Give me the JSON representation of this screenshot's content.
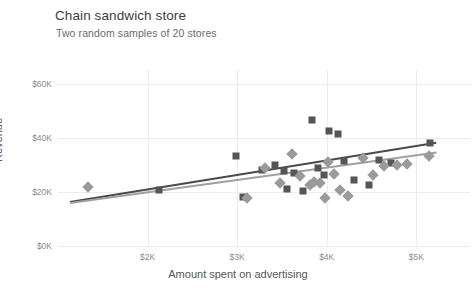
{
  "header": {
    "title": "Chain sandwich store",
    "subtitle": "Two random samples of 20 stores"
  },
  "chart_data": {
    "type": "scatter",
    "title": "Chain sandwich store",
    "subtitle": "Two random samples of 20 stores",
    "xlabel": "Amount spent on advertising",
    "ylabel": "Revenue",
    "xlim": [
      1000,
      5600
    ],
    "ylim": [
      0,
      65000
    ],
    "xticks": [
      2000,
      3000,
      4000,
      5000
    ],
    "xticklabels": [
      "$2K",
      "$3K",
      "$4K",
      "$5K"
    ],
    "yticks": [
      0,
      20000,
      40000,
      60000
    ],
    "yticklabels": [
      "$0K",
      "$20K",
      "$40K",
      "$60K"
    ],
    "grid": true,
    "legend": "none",
    "series": [
      {
        "name": "Sample 1",
        "marker": "square",
        "color": "#555555",
        "points": [
          [
            2130,
            20800
          ],
          [
            2985,
            33400
          ],
          [
            3065,
            18100
          ],
          [
            3275,
            28200
          ],
          [
            3420,
            29800
          ],
          [
            3520,
            27600
          ],
          [
            3560,
            21100
          ],
          [
            3640,
            26900
          ],
          [
            3730,
            20300
          ],
          [
            3840,
            46600
          ],
          [
            3900,
            28800
          ],
          [
            3975,
            26100
          ],
          [
            4030,
            42400
          ],
          [
            4130,
            41200
          ],
          [
            4190,
            31300
          ],
          [
            4300,
            24500
          ],
          [
            4470,
            22600
          ],
          [
            4580,
            31600
          ],
          [
            4720,
            30600
          ],
          [
            5150,
            37900
          ]
        ],
        "trendline": {
          "x0": 1130,
          "y0": 16800,
          "x1": 5220,
          "y1": 38700
        }
      },
      {
        "name": "Sample 2",
        "marker": "diamond",
        "color": "#9a9a9a",
        "points": [
          [
            1330,
            21900
          ],
          [
            3110,
            17800
          ],
          [
            3310,
            28700
          ],
          [
            3480,
            23100
          ],
          [
            3610,
            33800
          ],
          [
            3700,
            25900
          ],
          [
            3810,
            22400
          ],
          [
            3860,
            23500
          ],
          [
            3920,
            23300
          ],
          [
            3980,
            17700
          ],
          [
            4020,
            31200
          ],
          [
            4080,
            26700
          ],
          [
            4150,
            20700
          ],
          [
            4240,
            18600
          ],
          [
            4400,
            32400
          ],
          [
            4520,
            26300
          ],
          [
            4640,
            29400
          ],
          [
            4790,
            29900
          ],
          [
            4900,
            30100
          ],
          [
            5140,
            33300
          ]
        ],
        "trendline": {
          "x0": 1130,
          "y0": 16300,
          "x1": 5220,
          "y1": 34900
        }
      }
    ]
  }
}
